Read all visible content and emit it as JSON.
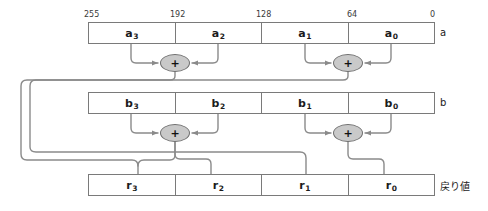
{
  "diagram": {
    "colors": {
      "wire": "#8a8a8a",
      "box_border": "#7a7a7a",
      "adder_fill": "#c9c9c9",
      "adder_border": "#6f6f6f",
      "text": "#1b1b1b",
      "background": "#ffffff"
    },
    "bit_labels": [
      {
        "text": "255",
        "x": 84,
        "y": 10,
        "align": "left"
      },
      {
        "text": "192",
        "x": 170,
        "y": 10,
        "align": "left"
      },
      {
        "text": "128",
        "x": 256,
        "y": 10,
        "align": "left"
      },
      {
        "text": "64",
        "x": 347,
        "y": 10,
        "align": "left"
      },
      {
        "text": "0",
        "x": 430,
        "y": 10,
        "align": "left"
      }
    ],
    "registers": [
      {
        "name": "register-a",
        "label": "a",
        "label_x": 440,
        "label_y": 31,
        "x": 88,
        "y": 22,
        "width": 347,
        "height": 22,
        "cells": [
          {
            "name": "cell-a3",
            "base": "a",
            "sub": "3"
          },
          {
            "name": "cell-a2",
            "base": "a",
            "sub": "2"
          },
          {
            "name": "cell-a1",
            "base": "a",
            "sub": "1"
          },
          {
            "name": "cell-a0",
            "base": "a",
            "sub": "0"
          }
        ]
      },
      {
        "name": "register-b",
        "label": "b",
        "label_x": 440,
        "label_y": 101,
        "x": 88,
        "y": 92,
        "width": 347,
        "height": 22,
        "cells": [
          {
            "name": "cell-b3",
            "base": "b",
            "sub": "3"
          },
          {
            "name": "cell-b2",
            "base": "b",
            "sub": "2"
          },
          {
            "name": "cell-b1",
            "base": "b",
            "sub": "1"
          },
          {
            "name": "cell-b0",
            "base": "b",
            "sub": "0"
          }
        ]
      },
      {
        "name": "register-r",
        "label": "戻り値",
        "label_x": 440,
        "label_y": 183,
        "x": 88,
        "y": 174,
        "width": 347,
        "height": 22,
        "cells": [
          {
            "name": "cell-r3",
            "base": "r",
            "sub": "3"
          },
          {
            "name": "cell-r2",
            "base": "r",
            "sub": "2"
          },
          {
            "name": "cell-r1",
            "base": "r",
            "sub": "1"
          },
          {
            "name": "cell-r0",
            "base": "r",
            "sub": "0"
          }
        ]
      }
    ],
    "adders": [
      {
        "name": "adder-a-high",
        "symbol": "+",
        "cx": 175,
        "cy": 63
      },
      {
        "name": "adder-a-low",
        "symbol": "+",
        "cx": 348,
        "cy": 63
      },
      {
        "name": "adder-b-high",
        "symbol": "+",
        "cx": 175,
        "cy": 133
      },
      {
        "name": "adder-b-low",
        "symbol": "+",
        "cx": 348,
        "cy": 133
      }
    ]
  }
}
